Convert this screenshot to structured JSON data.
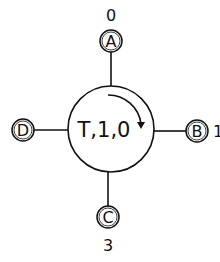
{
  "diagram": {
    "hub": {
      "label": "T,1,0",
      "cx": 111,
      "cy": 129,
      "r": 43,
      "rotation": "clockwise"
    },
    "nodes": [
      {
        "id": "A",
        "label": "A",
        "index": "0",
        "cx": 111,
        "cy": 41,
        "side": "top"
      },
      {
        "id": "B",
        "label": "B",
        "index": "1",
        "cx": 197,
        "cy": 131,
        "side": "right"
      },
      {
        "id": "C",
        "label": "C",
        "index": "3",
        "cx": 108,
        "cy": 217,
        "side": "bottom"
      },
      {
        "id": "D",
        "label": "D",
        "index": "",
        "cx": 23,
        "cy": 130,
        "side": "left"
      }
    ],
    "colors": {
      "stroke": "#111111",
      "background": "#ffffff"
    }
  }
}
